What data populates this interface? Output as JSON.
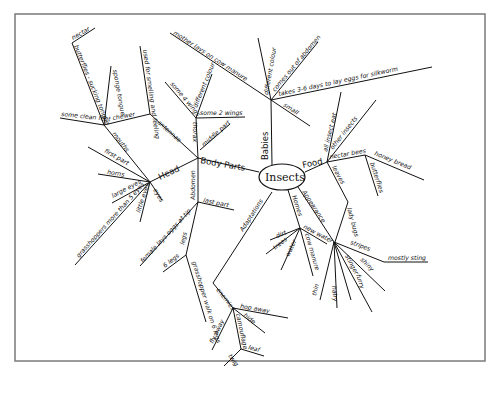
{
  "diagram": {
    "type": "mind-map",
    "center": "Insects",
    "branches": {
      "body_parts": {
        "label": "Body Parts",
        "children": {
          "head": {
            "label": "Head",
            "children": [
              "mouths",
              "first part",
              "horns",
              "large eyes",
              "grasshoppers more than 5 eyes",
              "little eyes",
              "eyes"
            ],
            "mouths": {
              "label": "mouths",
              "chewer": "chewer",
              "some clean feet": "some clean feet",
              "butterflies": "butterflies - sucking tongue",
              "nectar": "nectar",
              "sponge": "sponge tongue"
            }
          },
          "antennae": {
            "label": "antennae",
            "used": "used for smelling and feeling"
          },
          "thorax": {
            "label": "thorax",
            "some_2_wings": "some 2 wings",
            "some_4_wings": "some 4 wings",
            "different_colour": "different colour",
            "middle_part": "middle part"
          },
          "abdomen": {
            "label": "Abdomen",
            "last_part": "last part",
            "female": "female lays eggs at tip",
            "legs": "legs",
            "six_legs": "6 legs",
            "grasshopper": "grasshopper walk on 6 legs"
          }
        }
      },
      "babies": {
        "label": "Babies",
        "different_colour": "different colour",
        "comes_out": "comes out of abdomen",
        "small": "small",
        "takes": "takes 3-6 days to lay eggs for silkworm",
        "mother": "mother lays on cow manure"
      },
      "food": {
        "label": "Food",
        "all_insect_eat": "all insect eat",
        "other_insects": "other insects",
        "nectar_bees": "nectar bees",
        "honey_bread": "honey bread",
        "butterflies": "butterflies",
        "leaves": "leaves",
        "lady_bugs": "lady bugs"
      },
      "appearance": {
        "label": "Appearance",
        "stripes": "stripes",
        "mostly_sting": "mostly sting",
        "stinger": "stinger",
        "shiny": "shiny",
        "furry": "furry",
        "hairy": "hairy",
        "thin": "thin"
      },
      "homes": {
        "label": "Homes",
        "new_water": "new water",
        "cow_manure": "cow manure",
        "water": "water",
        "trees": "trees",
        "dirt": "dirt"
      },
      "adaptations": {
        "label": "Adaptations",
        "enemies": "enemies",
        "hop_away": "hop away",
        "hide": "hide",
        "fly_away": "fly away",
        "camouflage": "camouflage",
        "leaf": "leaf",
        "twig": "twig"
      }
    }
  }
}
